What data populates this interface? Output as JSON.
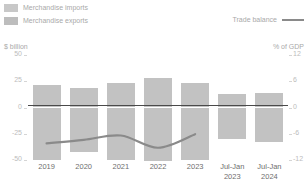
{
  "legend": {
    "imports_label": "Merchandise imports",
    "exports_label": "Merchandise exports",
    "balance_label": "Trade balance"
  },
  "axes": {
    "left_unit": "$ billion",
    "right_unit": "% of GDP"
  },
  "colors": {
    "bar": "#c2c2c2",
    "imports_swatch": "#c8c8c8",
    "exports_swatch": "#bdbdbd",
    "line": "#8a8a8a",
    "zero_line": "#4a4a4a",
    "tick_text": "#bcbcbc",
    "xlabel_text": "#6e6e6e",
    "legend_text": "#a9a9a9"
  },
  "chart_data": {
    "type": "bar",
    "title": "",
    "xlabel": "",
    "ylabel": "$ billion",
    "y2label": "% of GDP",
    "grid": false,
    "legend_position": "top",
    "categories": [
      "2019",
      "2020",
      "2021",
      "2022",
      "2023",
      "Jul-Jan 2023",
      "Jul-Jan 2024"
    ],
    "category_lines": [
      [
        "2019"
      ],
      [
        "2020"
      ],
      [
        "2021"
      ],
      [
        "2022"
      ],
      [
        "2023"
      ],
      [
        "Jul-Jan",
        "2023"
      ],
      [
        "Jul-Jan",
        "2024"
      ]
    ],
    "ylim": [
      -50,
      50
    ],
    "yticks": [
      50,
      25,
      0,
      -25,
      -50
    ],
    "ytick_labels": [
      "50",
      "25",
      "0",
      "-25",
      "-50"
    ],
    "y2lim": [
      -12,
      12
    ],
    "y2ticks": [
      12,
      6,
      0,
      -6,
      -12
    ],
    "y2tick_labels": [
      "12",
      "6",
      "0",
      "-6",
      "-12"
    ],
    "series": [
      {
        "name": "Merchandise exports",
        "axis": "left",
        "values": [
          21,
          19,
          23,
          28,
          23,
          13,
          14
        ]
      },
      {
        "name": "Merchandise imports",
        "axis": "left",
        "values": [
          -50,
          -42,
          -50,
          -51,
          -50,
          -30,
          -33
        ]
      },
      {
        "name": "Trade balance",
        "axis": "right",
        "type": "line",
        "x": [
          "2019",
          "2020",
          "2021",
          "2022",
          "2023"
        ],
        "values": [
          -8.2,
          -7.4,
          -6.4,
          -9.2,
          -6.1
        ]
      }
    ]
  }
}
